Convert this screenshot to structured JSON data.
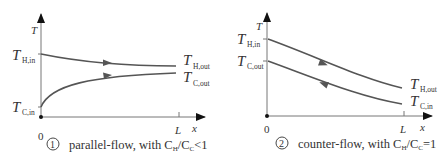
{
  "diagrams": [
    {
      "id": "parallel",
      "number": "1",
      "caption": "parallel-flow, with C",
      "caption_sub_h": "H",
      "caption_mid": "/C",
      "caption_sub_c": "C",
      "caption_end": "<1",
      "y_axis_label": "T",
      "x_axis_label": "x",
      "x_tick_0": "0",
      "x_tick_L": "L",
      "labels": {
        "h_in": {
          "main": "T",
          "sub": "H,in"
        },
        "c_in": {
          "main": "T",
          "sub": "C,in"
        },
        "h_out": {
          "main": "T",
          "sub": "H,out"
        },
        "c_out": {
          "main": "T",
          "sub": "C,out"
        }
      },
      "flow_direction": {
        "hot": "right",
        "cold": "right"
      }
    },
    {
      "id": "counter",
      "number": "2",
      "caption": "counter-flow, with C",
      "caption_sub_h": "H",
      "caption_mid": "/C",
      "caption_sub_c": "C",
      "caption_end": "=1",
      "y_axis_label": "T",
      "x_axis_label": "x",
      "x_tick_0": "0",
      "x_tick_L": "L",
      "labels": {
        "h_in": {
          "main": "T",
          "sub": "H,in"
        },
        "c_out": {
          "main": "T",
          "sub": "C,out"
        },
        "h_out": {
          "main": "T",
          "sub": "H,out"
        },
        "c_in": {
          "main": "T",
          "sub": "C,in"
        }
      },
      "flow_direction": {
        "hot": "right",
        "cold": "left"
      }
    }
  ],
  "colors": {
    "curve": "#555555",
    "axis": "#777777",
    "text": "#333333"
  }
}
